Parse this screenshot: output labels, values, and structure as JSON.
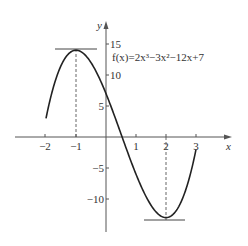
{
  "chart_data": {
    "type": "line",
    "title": "",
    "function_label": "f(x)=2x³−3x²−12x+7",
    "xlabel": "x",
    "ylabel": "y",
    "xlim": [
      -2.9,
      4.2
    ],
    "ylim": [
      -14.5,
      17
    ],
    "x_ticks": [
      -2,
      -1,
      1,
      2,
      3
    ],
    "x_tick_labels": [
      "−2",
      "−1",
      "1",
      "2",
      "3"
    ],
    "y_ticks": [
      15,
      10,
      5,
      -5,
      -10
    ],
    "y_tick_labels": [
      "15",
      "10",
      "5",
      "−5",
      "−10"
    ],
    "grid": false,
    "series": [
      {
        "name": "f(x)=2x^3-3x^2-12x+7",
        "domain": [
          -2,
          3
        ],
        "x": [
          -2,
          -1.5,
          -1,
          -0.5,
          0,
          0.5,
          1,
          1.5,
          2,
          2.5,
          3
        ],
        "values": [
          3,
          11,
          14,
          12.5,
          7,
          0.5,
          -6,
          -11,
          -13,
          -10.5,
          -2
        ]
      }
    ],
    "annotations": [
      {
        "type": "horizontal_tangent",
        "x": -1,
        "y": 14,
        "label": "local maximum"
      },
      {
        "type": "horizontal_tangent",
        "x": 2,
        "y": -13,
        "label": "local minimum"
      },
      {
        "type": "dashed_vertical",
        "x": -1,
        "from": 0,
        "to": 14
      },
      {
        "type": "dashed_vertical",
        "x": 2,
        "from": 0,
        "to": -13
      }
    ],
    "colors": {
      "curve": "#222222",
      "axis": "#555555",
      "tangent": "#444444"
    }
  }
}
